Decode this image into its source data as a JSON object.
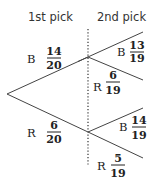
{
  "headers": {
    "first": "1st pick",
    "second": "2nd pick"
  },
  "first_pick": [
    {
      "label": "B",
      "numerator": "14",
      "denominator": "20"
    },
    {
      "label": "R",
      "numerator": "6",
      "denominator": "20"
    }
  ],
  "second_pick": [
    {
      "after": "B",
      "label": "B",
      "numerator": "13",
      "denominator": "19"
    },
    {
      "after": "B",
      "label": "R",
      "numerator": "6",
      "denominator": "19"
    },
    {
      "after": "R",
      "label": "B",
      "numerator": "14",
      "denominator": "19"
    },
    {
      "after": "R",
      "label": "R",
      "numerator": "5",
      "denominator": "19"
    }
  ]
}
